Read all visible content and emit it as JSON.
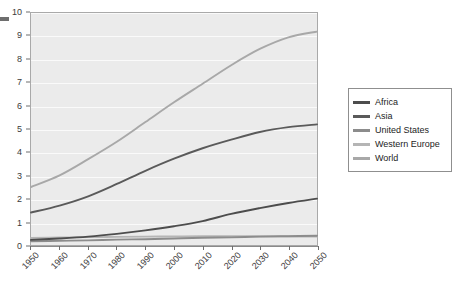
{
  "chart_data": {
    "type": "line",
    "title": "",
    "xlabel": "",
    "ylabel": "",
    "xlim": [
      1950,
      2050
    ],
    "ylim": [
      0,
      10
    ],
    "grid": true,
    "legend_position": "right",
    "x": [
      1950,
      1960,
      1970,
      1980,
      1990,
      2000,
      2010,
      2020,
      2030,
      2040,
      2050
    ],
    "xtick_labels": [
      "1950",
      "1960",
      "1970",
      "1980",
      "1990",
      "2000",
      "2010",
      "2020",
      "2030",
      "2040",
      "2050"
    ],
    "ytick_labels": [
      "0",
      "1",
      "2",
      "3",
      "4",
      "5",
      "6",
      "7",
      "8",
      "9",
      "10"
    ],
    "series": [
      {
        "name": "Africa",
        "color": "#4d4d4d",
        "values": [
          0.22,
          0.28,
          0.36,
          0.48,
          0.63,
          0.81,
          1.03,
          1.34,
          1.59,
          1.81,
          2.0
        ]
      },
      {
        "name": "Asia",
        "color": "#5a5a5a",
        "values": [
          1.4,
          1.7,
          2.1,
          2.63,
          3.2,
          3.72,
          4.17,
          4.54,
          4.87,
          5.08,
          5.2
        ]
      },
      {
        "name": "United States",
        "color": "#8c8c8c",
        "values": [
          0.16,
          0.18,
          0.2,
          0.23,
          0.25,
          0.28,
          0.31,
          0.33,
          0.36,
          0.38,
          0.4
        ]
      },
      {
        "name": "Western Europe",
        "color": "#b5b5b5",
        "values": [
          0.3,
          0.32,
          0.34,
          0.35,
          0.36,
          0.37,
          0.38,
          0.38,
          0.38,
          0.37,
          0.36
        ]
      },
      {
        "name": "World",
        "color": "#a8a8a8",
        "values": [
          2.5,
          3.0,
          3.7,
          4.45,
          5.3,
          6.15,
          6.95,
          7.75,
          8.45,
          8.95,
          9.2
        ]
      }
    ]
  },
  "legend": {
    "entries": [
      {
        "label": "Africa"
      },
      {
        "label": "Asia"
      },
      {
        "label": "United States"
      },
      {
        "label": "Western Europe"
      },
      {
        "label": "World"
      }
    ]
  }
}
